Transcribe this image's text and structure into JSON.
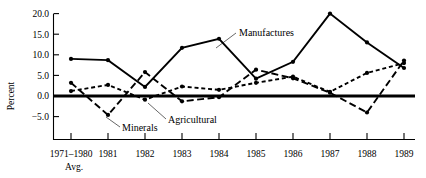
{
  "chart_data": {
    "type": "line",
    "title": "",
    "xlabel": "",
    "ylabel": "Percent",
    "ylim": [
      -7.5,
      21.5
    ],
    "yticks": [
      -5.0,
      0.0,
      5.0,
      10.0,
      15.0,
      20.0
    ],
    "ytick_labels": [
      "−5.0",
      "0.0",
      "5.0",
      "10.0",
      "15.0",
      "20.0"
    ],
    "grid": false,
    "legend_position": "inline-annotations",
    "zero_line": true,
    "categories": [
      "1971–1980",
      "1981",
      "1982",
      "1983",
      "1984",
      "1985",
      "1986",
      "1987",
      "1988",
      "1989"
    ],
    "x_first_sublabel": "Avg.",
    "xtick_labels": [
      "1971–1980",
      "1981",
      "1982",
      "1983",
      "1984",
      "1985",
      "1986",
      "1987",
      "1988",
      "1989"
    ],
    "series": [
      {
        "name": "Manufactures",
        "style": "solid",
        "marker": "dot",
        "values": [
          9.0,
          8.7,
          2.2,
          11.7,
          13.9,
          4.2,
          8.3,
          20.0,
          13.0,
          6.8
        ]
      },
      {
        "name": "Minerals",
        "style": "long-dash",
        "marker": "dot",
        "values": [
          3.2,
          -4.6,
          5.8,
          -1.3,
          -0.3,
          6.4,
          4.3,
          0.8,
          -4.0,
          8.6
        ]
      },
      {
        "name": "Agricultural",
        "style": "short-dash",
        "marker": "dot",
        "values": [
          1.2,
          2.7,
          -0.9,
          2.3,
          1.5,
          3.2,
          4.7,
          1.0,
          5.6,
          8.0
        ]
      }
    ],
    "annotations": [
      {
        "text": "Manufactures",
        "x": 239,
        "y": 36,
        "leader": [
          [
            236,
            33
          ],
          [
            216,
            48
          ]
        ]
      },
      {
        "text": "Minerals",
        "x": 122,
        "y": 131,
        "leader": [
          [
            120,
            127
          ],
          [
            106,
            117
          ]
        ]
      },
      {
        "text": "Agricultural",
        "x": 168,
        "y": 123,
        "leader": [
          [
            166,
            119
          ],
          [
            148,
            103
          ]
        ]
      }
    ]
  }
}
